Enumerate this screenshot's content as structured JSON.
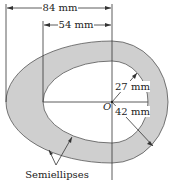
{
  "figure": {
    "dim_outer": "84 mm",
    "dim_inner": "54 mm",
    "radius_inner": "27 mm",
    "radius_outer": "42 mm",
    "center_label": "O",
    "annotation": "Semiellipses",
    "fill_color": "#cfcfcf",
    "line_color": "#333333"
  }
}
